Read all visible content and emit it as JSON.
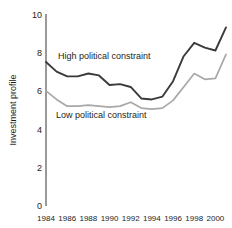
{
  "chart_data": {
    "type": "line",
    "title": "",
    "subtitle": "",
    "xlabel": "",
    "ylabel": "Investment profile",
    "xlim": [
      1984,
      2001
    ],
    "ylim": [
      0,
      10
    ],
    "yticks": [
      "0",
      "2",
      "4",
      "6",
      "8",
      "10"
    ],
    "ytick_values": [
      0,
      2,
      4,
      6,
      8,
      10
    ],
    "xticks": [
      "1984",
      "1986",
      "1988",
      "1990",
      "1992",
      "1994",
      "1996",
      "1998",
      "2000"
    ],
    "xtick_values": [
      1984,
      1986,
      1988,
      1990,
      1992,
      1994,
      1996,
      1998,
      2000
    ],
    "x": [
      1984,
      1985,
      1986,
      1987,
      1988,
      1989,
      1990,
      1991,
      1992,
      1993,
      1994,
      1995,
      1996,
      1997,
      1998,
      1999,
      2000,
      2001
    ],
    "grid": false,
    "legend_position": "inline-annotation",
    "series": [
      {
        "name": "High political constraint",
        "color": "#3a3a3a",
        "width": 1.9,
        "values": [
          7.5,
          7.0,
          6.75,
          6.75,
          6.9,
          6.8,
          6.3,
          6.35,
          6.2,
          5.6,
          5.55,
          5.7,
          6.5,
          7.8,
          8.5,
          8.25,
          8.1,
          9.3
        ],
        "annotation": {
          "text": "High political constraint",
          "x_px": 58,
          "y_px": 59
        }
      },
      {
        "name": "Low political constraint",
        "color": "#a8a8a8",
        "width": 1.7,
        "values": [
          6.0,
          5.55,
          5.2,
          5.2,
          5.25,
          5.2,
          5.15,
          5.2,
          5.4,
          5.1,
          5.05,
          5.1,
          5.5,
          6.2,
          6.9,
          6.6,
          6.65,
          7.9
        ],
        "annotation": {
          "text": "Low political constraint",
          "x_px": 56,
          "y_px": 118
        }
      }
    ]
  },
  "axes": {
    "y_axis_title": "Investment profile"
  }
}
